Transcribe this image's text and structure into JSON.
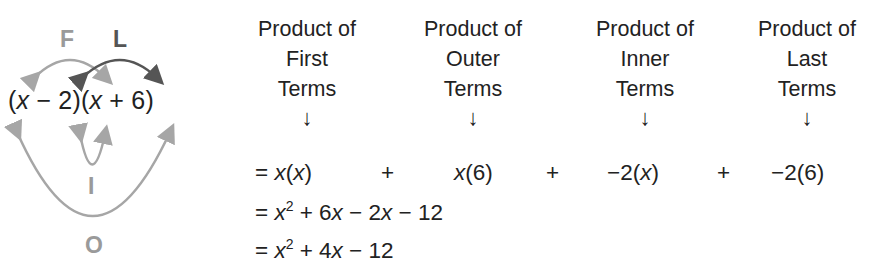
{
  "foil_diagram": {
    "expression": {
      "open1": "(",
      "x1": "x",
      "rest1": " − 2)(",
      "x2": "x",
      "rest2": " + 6)"
    },
    "labels": {
      "first": "F",
      "last": "L",
      "inner": "I",
      "outer": "O"
    },
    "colors": {
      "light_arrow": "#a6a6a6",
      "dark_arrow": "#555555",
      "light_label": "#9a9a9a",
      "dark_label": "#555555"
    }
  },
  "headers": [
    {
      "line1": "Product of",
      "line2": "First",
      "line3": "Terms",
      "arrow": "↓"
    },
    {
      "line1": "Product of",
      "line2": "Outer",
      "line3": "Terms",
      "arrow": "↓"
    },
    {
      "line1": "Product of",
      "line2": "Inner",
      "line3": "Terms",
      "arrow": "↓"
    },
    {
      "line1": "Product of",
      "line2": "Last",
      "line3": "Terms",
      "arrow": "↓"
    }
  ],
  "steps": {
    "line1": {
      "eq": "= ",
      "t1_var": "x",
      "t1_open": "(",
      "t1_var2": "x",
      "t1_close": ")",
      "plus1": "+",
      "t2_var": "x",
      "t2_rest": "(6)",
      "plus2": "+",
      "t3_pre": "−2(",
      "t3_var": "x",
      "t3_close": ")",
      "plus3": "+",
      "t4": "−2(6)"
    },
    "line2": {
      "eq": "= ",
      "var": "x",
      "exp": "2",
      "mid1": " + 6",
      "var2": "x",
      "mid2": " − 2",
      "var3": "x",
      "tail": " − 12"
    },
    "line3": {
      "eq": "= ",
      "var": "x",
      "exp": "2",
      "mid1": " + 4",
      "var2": "x",
      "tail": " − 12"
    }
  }
}
